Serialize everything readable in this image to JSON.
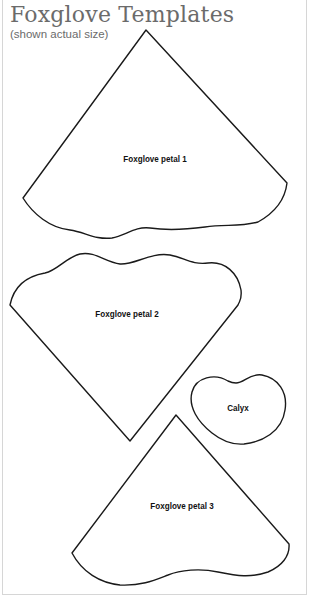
{
  "header": {
    "title": "Foxglove Templates",
    "subtitle": "(shown actual size)"
  },
  "templates": [
    {
      "label": "Foxglove petal 1"
    },
    {
      "label": "Foxglove petal 2"
    },
    {
      "label": "Calyx"
    },
    {
      "label": "Foxglove petal 3"
    }
  ],
  "colors": {
    "outline": "#1a1a1a",
    "title": "#6b6b6b",
    "frame": "#d6d6d6"
  }
}
